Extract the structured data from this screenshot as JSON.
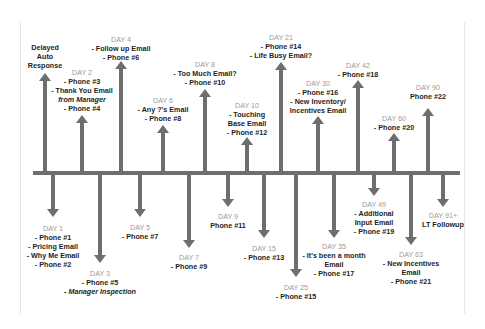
{
  "diagram": {
    "title": "",
    "type": "timeline",
    "colors": {
      "arrow": "#6e6e6e",
      "day_label": "#9a9a9a",
      "text": "#1e1e1e"
    },
    "above": [
      {
        "id": "auto",
        "x": 45,
        "tip": 73,
        "ty": 43,
        "day": "",
        "lines": [
          "Delayed",
          "Auto",
          "Response"
        ]
      },
      {
        "id": "day2",
        "x": 82,
        "tip": 115,
        "ty": 68,
        "day": "DAY 2",
        "lines": [
          "- Phone #3",
          "- Thank You Email",
          "from Manager",
          "- Phone #4"
        ],
        "italic": [
          2
        ]
      },
      {
        "id": "day4",
        "x": 121,
        "tip": 61,
        "ty": 35,
        "day": "DAY 4",
        "lines": [
          "- Follow up Email",
          "- Phone #6"
        ]
      },
      {
        "id": "day6",
        "x": 163,
        "tip": 125,
        "ty": 96,
        "day": "DAY 6",
        "lines": [
          "- Any ?'s Email",
          "- Phone #8"
        ]
      },
      {
        "id": "day8",
        "x": 205,
        "tip": 89,
        "ty": 60,
        "day": "DAY 8",
        "lines": [
          "- Too Much Email?",
          "- Phone #10"
        ]
      },
      {
        "id": "day10",
        "x": 247,
        "tip": 137,
        "ty": 101,
        "day": "DAY 10",
        "lines": [
          "- Touching",
          "Base Email",
          "- Phone #12"
        ]
      },
      {
        "id": "day21",
        "x": 281,
        "tip": 62,
        "ty": 33,
        "day": "DAY 21",
        "lines": [
          "- Phone #14",
          "- Life Busy Email?"
        ]
      },
      {
        "id": "day30",
        "x": 318,
        "tip": 116,
        "ty": 79,
        "day": "DAY 30",
        "lines": [
          "- Phone #16",
          "- New Inventory/",
          "Incentives Email"
        ]
      },
      {
        "id": "day42",
        "x": 358,
        "tip": 80,
        "ty": 61,
        "day": "DAY 42",
        "lines": [
          "- Phone #18"
        ]
      },
      {
        "id": "day60",
        "x": 394,
        "tip": 133,
        "ty": 114,
        "day": "DAY 60",
        "lines": [
          "- Phone #20"
        ]
      },
      {
        "id": "day90",
        "x": 428,
        "tip": 108,
        "ty": 83,
        "day": "DAY 90",
        "lines": [
          "Phone #22"
        ]
      }
    ],
    "below": [
      {
        "id": "day1",
        "x": 53,
        "tip": 217,
        "ty": 224,
        "day": "DAY 1",
        "lines": [
          "- Phone #1",
          "- Pricing Email",
          "- Why Me Email",
          "- Phone #2"
        ]
      },
      {
        "id": "day3",
        "x": 100,
        "tip": 263,
        "ty": 269,
        "day": "DAY 3",
        "lines": [
          "- Phone #5",
          "- Manager Inspection"
        ],
        "italic": [
          1
        ]
      },
      {
        "id": "day5",
        "x": 140,
        "tip": 217,
        "ty": 223,
        "day": "DAY 5",
        "lines": [
          "- Phone #7"
        ]
      },
      {
        "id": "day7",
        "x": 189,
        "tip": 248,
        "ty": 253,
        "day": "DAY 7",
        "lines": [
          "- Phone #9"
        ]
      },
      {
        "id": "day9",
        "x": 228,
        "tip": 207,
        "ty": 212,
        "day": "DAY 9",
        "lines": [
          "Phone #11"
        ]
      },
      {
        "id": "day15",
        "x": 264,
        "tip": 238,
        "ty": 244,
        "day": "DAY 15",
        "lines": [
          "- Phone #13"
        ]
      },
      {
        "id": "day25",
        "x": 296,
        "tip": 277,
        "ty": 283,
        "day": "DAY 25",
        "lines": [
          "- Phone #15"
        ]
      },
      {
        "id": "day35",
        "x": 334,
        "tip": 238,
        "ty": 242,
        "day": "DAY 35",
        "lines": [
          "- It's been a month",
          "Email",
          "- Phone #17"
        ]
      },
      {
        "id": "day49",
        "x": 374,
        "tip": 196,
        "ty": 200,
        "day": "DAY 49",
        "lines": [
          "- Additional",
          "Input Email",
          "- Phone #19"
        ]
      },
      {
        "id": "day63",
        "x": 411,
        "tip": 245,
        "ty": 250,
        "day": "DAY 63",
        "lines": [
          "- New Incentives",
          "Email",
          "- Phone #21"
        ]
      },
      {
        "id": "day91",
        "x": 443,
        "tip": 207,
        "ty": 211,
        "day": "DAY 91+",
        "lines": [
          "LT Followup"
        ]
      }
    ]
  }
}
